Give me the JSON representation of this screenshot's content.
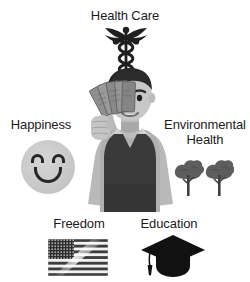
{
  "figure": {
    "background_color": "#ffffff",
    "text_color": "#1b1b1b",
    "style": "grayscale flat illustration"
  },
  "labels": {
    "health_care": "Health Care",
    "happiness": "Happiness",
    "environmental_health": "Environmental Health",
    "freedom": "Freedom",
    "education": "Education"
  },
  "icons": {
    "health_care": "caduceus-icon",
    "happiness": "smiley-face-icon",
    "environmental_health": "two-trees-icon",
    "freedom": "us-flag-icon",
    "education": "graduation-cap-icon",
    "center": "man-holding-money-icon"
  },
  "colors": {
    "ink": "#262626",
    "dark_gray": "#3c3c3c",
    "mid_gray": "#6e6e6e",
    "light_gray": "#c8c8c8",
    "pale_gray": "#d9d9d9",
    "skin": "#c9c9c9",
    "hair": "#2b2b2b",
    "vest": "#3a3a3a",
    "shirt": "#a9a9a9",
    "money": "#8a8a8a"
  }
}
